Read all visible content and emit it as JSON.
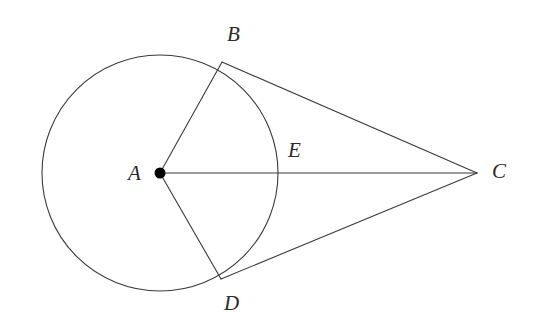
{
  "figure": {
    "type": "geometry-diagram",
    "canvas": {
      "width": 544,
      "height": 333,
      "background": "#ffffff"
    },
    "style": {
      "stroke_color": "#3a3a3a",
      "stroke_width": 1.1,
      "point_fill": "#000000",
      "label_color": "#2b2b2b",
      "label_font_size": 21
    },
    "circle": {
      "name": "circle-A",
      "center": {
        "x": 160,
        "y": 173
      },
      "radius": 118
    },
    "points": [
      {
        "id": "A",
        "label": "A",
        "x": 160,
        "y": 173,
        "marker": "filled-dot",
        "marker_radius": 5.5,
        "label_x": 128,
        "label_y": 163
      },
      {
        "id": "B",
        "label": "B",
        "x": 222,
        "y": 62,
        "marker": "none",
        "label_x": 227,
        "label_y": 24
      },
      {
        "id": "C",
        "label": "C",
        "x": 477,
        "y": 173,
        "marker": "none",
        "label_x": 492,
        "label_y": 161
      },
      {
        "id": "D",
        "label": "D",
        "x": 221,
        "y": 279,
        "marker": "none",
        "label_x": 224,
        "label_y": 293
      },
      {
        "id": "E",
        "label": "E",
        "x": 278,
        "y": 173,
        "marker": "none",
        "label_x": 288,
        "label_y": 140
      }
    ],
    "segments": [
      {
        "id": "AB",
        "from": "A",
        "to": "B",
        "role": "radius"
      },
      {
        "id": "AD",
        "from": "A",
        "to": "D",
        "role": "radius"
      },
      {
        "id": "AC",
        "from": "A",
        "to": "C",
        "role": "center-to-external-point-through-E"
      },
      {
        "id": "BC",
        "from": "B",
        "to": "C",
        "role": "tangent"
      },
      {
        "id": "DC",
        "from": "D",
        "to": "C",
        "role": "tangent"
      }
    ],
    "labels_text": {
      "A": "A",
      "B": "B",
      "C": "C",
      "D": "D",
      "E": "E"
    }
  }
}
